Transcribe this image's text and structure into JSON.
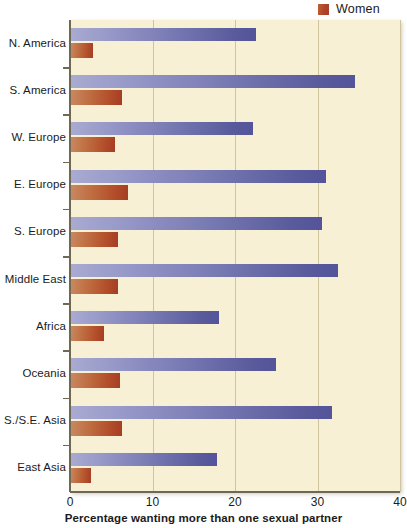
{
  "legend": {
    "position": "top-right",
    "entries": [
      {
        "label": "Women",
        "color": "#b0442a",
        "swatch_icon": "legend-square-icon"
      }
    ]
  },
  "axis": {
    "x_title": "Percentage wanting more than one sexual partner",
    "x_ticks": [
      "0",
      "10",
      "20",
      "30",
      "40"
    ]
  },
  "colors": {
    "men_bar": "#7173ae",
    "women_bar": "#b0442a",
    "plot_background": "#f7f0d4",
    "gridline": "#cfc49c",
    "axis_line": "#6f6855",
    "text": "#1b1b1b"
  },
  "chart_data": {
    "type": "bar",
    "orientation": "horizontal",
    "title": "",
    "subtitle": "",
    "xlabel": "Percentage wanting more than one sexual partner",
    "ylabel": "",
    "xlim": [
      0,
      40
    ],
    "xticks": [
      0,
      10,
      20,
      30,
      40
    ],
    "grid": true,
    "legend_position": "top-right",
    "categories": [
      "N. America",
      "S. America",
      "W. Europe",
      "E. Europe",
      "S. Europe",
      "Middle East",
      "Africa",
      "Oceania",
      "S./S.E. Asia",
      "East Asia"
    ],
    "series": [
      {
        "name": "Men",
        "color": "#7173ae",
        "values": [
          22.5,
          34.5,
          22.2,
          31.0,
          30.5,
          32.5,
          18.0,
          25.0,
          31.8,
          17.8
        ]
      },
      {
        "name": "Women",
        "color": "#b0442a",
        "values": [
          2.8,
          6.3,
          5.4,
          7.0,
          5.8,
          5.8,
          4.1,
          6.0,
          6.3,
          2.6
        ]
      }
    ]
  }
}
